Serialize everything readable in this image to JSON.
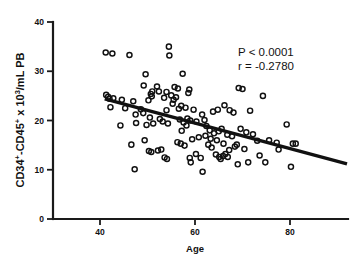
{
  "chart_data": {
    "type": "scatter",
    "title": "",
    "xlabel": "Age",
    "ylabel": "CD34+-CD45+ x 10³/mL PB",
    "ylabel_parts": {
      "seg1": "CD34",
      "sup1": "+",
      "seg2": "-CD45",
      "sup2": "+",
      "seg3": " x 10",
      "sup3": "3",
      "seg4": "/mL PB"
    },
    "xlim": [
      30,
      92
    ],
    "ylim": [
      0,
      40
    ],
    "xticks": [
      40,
      60,
      80
    ],
    "yticks": [
      0,
      10,
      20,
      30,
      40
    ],
    "xtick_labels": [
      "40",
      "60",
      "80"
    ],
    "ytick_labels": [
      "0",
      "10",
      "20",
      "30",
      "40"
    ],
    "grid": false,
    "legend": false,
    "marker_style": "open-circle",
    "marker_color": "#111111",
    "annotations": [
      {
        "id": "p-value",
        "text": "P < 0.0001",
        "x": 72,
        "y": 35.6
      },
      {
        "id": "r-value",
        "text": "r = -0.2780",
        "x": 72,
        "y": 33.1
      }
    ],
    "trendline": {
      "type": "linear-regression",
      "x_start": 41,
      "y_start": 24.4,
      "x_end": 92,
      "y_end": 11.2,
      "slope": -0.259,
      "intercept": 35.0,
      "r": -0.278,
      "p": "< 0.0001"
    },
    "series": [
      {
        "name": "subjects",
        "points": [
          [
            41.2,
            33.8
          ],
          [
            42.6,
            33.6
          ],
          [
            46.2,
            33.3
          ],
          [
            54.5,
            35.0
          ],
          [
            54.6,
            33.2
          ],
          [
            49.6,
            29.4
          ],
          [
            57.4,
            29.5
          ],
          [
            49.2,
            27.1
          ],
          [
            52.0,
            26.9
          ],
          [
            55.7,
            26.8
          ],
          [
            56.4,
            26.5
          ],
          [
            58.8,
            26.3
          ],
          [
            58.6,
            25.6
          ],
          [
            69.2,
            26.6
          ],
          [
            70.0,
            26.4
          ],
          [
            51.0,
            25.9
          ],
          [
            52.4,
            25.9
          ],
          [
            54.0,
            25.8
          ],
          [
            50.7,
            25.4
          ],
          [
            50.9,
            24.9
          ],
          [
            41.3,
            25.2
          ],
          [
            41.7,
            24.8
          ],
          [
            42.0,
            24.4
          ],
          [
            42.8,
            24.5
          ],
          [
            44.6,
            24.2
          ],
          [
            74.3,
            25.0
          ],
          [
            47.0,
            23.9
          ],
          [
            50.2,
            24.1
          ],
          [
            53.5,
            24.6
          ],
          [
            56.0,
            24.7
          ],
          [
            55.3,
            23.4
          ],
          [
            57.1,
            23.0
          ],
          [
            58.0,
            22.6
          ],
          [
            42.2,
            22.7
          ],
          [
            45.3,
            22.5
          ],
          [
            48.6,
            22.3
          ],
          [
            49.1,
            21.5
          ],
          [
            47.5,
            21.2
          ],
          [
            50.5,
            20.6
          ],
          [
            52.6,
            20.3
          ],
          [
            54.0,
            22.1
          ],
          [
            56.6,
            22.4
          ],
          [
            59.7,
            22.2
          ],
          [
            61.5,
            21.2
          ],
          [
            62.0,
            20.1
          ],
          [
            63.8,
            21.8
          ],
          [
            64.8,
            22.2
          ],
          [
            66.2,
            23.1
          ],
          [
            67.3,
            22.1
          ],
          [
            68.1,
            21.6
          ],
          [
            71.6,
            22.0
          ],
          [
            44.3,
            19.0
          ],
          [
            47.6,
            19.5
          ],
          [
            49.8,
            19.1
          ],
          [
            51.2,
            19.4
          ],
          [
            53.2,
            19.8
          ],
          [
            54.3,
            19.4
          ],
          [
            56.8,
            20.2
          ],
          [
            57.6,
            19.6
          ],
          [
            58.2,
            19.0
          ],
          [
            58.4,
            20.4
          ],
          [
            59.0,
            20.0
          ],
          [
            60.3,
            19.8
          ],
          [
            62.4,
            18.9
          ],
          [
            63.1,
            18.0
          ],
          [
            64.0,
            17.4
          ],
          [
            65.0,
            17.8
          ],
          [
            65.6,
            18.3
          ],
          [
            66.8,
            17.1
          ],
          [
            67.8,
            16.8
          ],
          [
            69.6,
            18.3
          ],
          [
            70.8,
            17.6
          ],
          [
            72.2,
            17.2
          ],
          [
            73.1,
            15.9
          ],
          [
            75.6,
            16.0
          ],
          [
            77.2,
            15.5
          ],
          [
            79.3,
            19.2
          ],
          [
            80.6,
            15.3
          ],
          [
            46.6,
            15.1
          ],
          [
            49.4,
            16.0
          ],
          [
            50.3,
            13.8
          ],
          [
            50.8,
            13.6
          ],
          [
            52.9,
            14.1
          ],
          [
            53.6,
            12.5
          ],
          [
            54.1,
            12.2
          ],
          [
            56.3,
            15.6
          ],
          [
            57.0,
            15.3
          ],
          [
            57.8,
            14.9
          ],
          [
            58.9,
            12.4
          ],
          [
            59.1,
            11.5
          ],
          [
            60.2,
            13.2
          ],
          [
            61.2,
            12.4
          ],
          [
            61.6,
            9.6
          ],
          [
            62.8,
            15.1
          ],
          [
            63.5,
            14.5
          ],
          [
            64.4,
            13.1
          ],
          [
            65.1,
            12.6
          ],
          [
            65.4,
            12.2
          ],
          [
            65.9,
            12.8
          ],
          [
            66.4,
            13.2
          ],
          [
            66.9,
            12.6
          ],
          [
            67.2,
            14.0
          ],
          [
            68.4,
            14.7
          ],
          [
            69.0,
            11.1
          ],
          [
            70.4,
            14.2
          ],
          [
            71.2,
            11.5
          ],
          [
            73.6,
            12.9
          ],
          [
            74.8,
            11.5
          ],
          [
            77.6,
            14.1
          ],
          [
            80.2,
            10.6
          ],
          [
            81.2,
            15.3
          ],
          [
            47.3,
            10.1
          ],
          [
            55.0,
            25.1
          ],
          [
            55.5,
            24.2
          ],
          [
            57.2,
            17.9
          ],
          [
            63.3,
            16.3
          ],
          [
            64.6,
            16.0
          ],
          [
            52.2,
            13.9
          ],
          [
            59.4,
            16.2
          ],
          [
            60.8,
            16.6
          ],
          [
            62.2,
            16.9
          ],
          [
            66.0,
            15.3
          ],
          [
            68.8,
            15.1
          ]
        ]
      }
    ]
  }
}
